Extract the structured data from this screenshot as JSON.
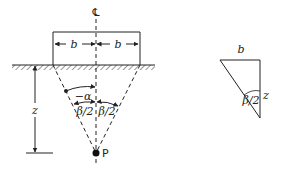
{
  "diagram": {
    "centerline_symbol": "℄",
    "footing": {
      "half_width_left_label": "b",
      "half_width_right_label": "b"
    },
    "depth_label": "z",
    "angle_alpha_label": "−α",
    "angle_half_beta_left_label": "β/2",
    "angle_half_beta_right_label": "β/2",
    "point_label": "P",
    "inset_triangle": {
      "top_label": "b",
      "side_label": "z",
      "angle_label": "β/2"
    },
    "colors": {
      "line": "#222222",
      "background": "#ffffff"
    }
  }
}
